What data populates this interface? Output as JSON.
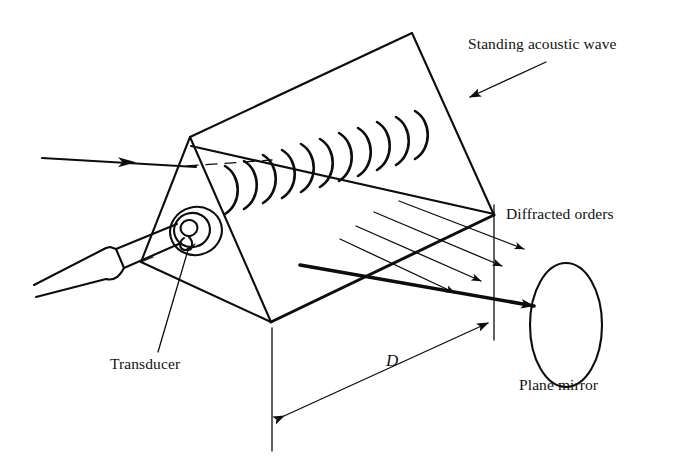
{
  "figure": {
    "background_color": "#ffffff",
    "ink_color": "#0d0d0d"
  },
  "labels": {
    "standing_acoustic_wave": "Standing acoustic wave",
    "diffracted_orders": "Diffracted orders",
    "plane_mirror": "Plane mirror",
    "transducer": "Transducer",
    "distance": "D"
  },
  "components": [
    {
      "name": "acousto-optic-cell",
      "shape": "triangular-prism",
      "vertices": {
        "front_apex": [
          190,
          137
        ],
        "back_apex": [
          412,
          33
        ],
        "front_bottom": [
          271,
          322
        ],
        "left_bottom": [
          141,
          262
        ],
        "right_bottom": [
          494,
          215
        ]
      }
    },
    {
      "name": "transducer",
      "shape": "concentric-ellipses",
      "center": [
        194,
        231
      ],
      "outer_radii": [
        26,
        24
      ],
      "inner_radii": [
        11,
        11
      ]
    },
    {
      "name": "transducer-cable",
      "shape": "tube",
      "from": [
        34,
        296
      ],
      "to": [
        172,
        232
      ]
    },
    {
      "name": "plane-mirror",
      "shape": "ellipse",
      "center": [
        566,
        325
      ],
      "rx": 36,
      "ry": 62
    },
    {
      "name": "standing-acoustic-wave",
      "shape": "arc-series",
      "arc_count": 11,
      "start": [
        220,
        196
      ],
      "end": [
        412,
        112
      ]
    },
    {
      "name": "incident-beam",
      "shape": "arrow",
      "from": [
        42,
        159
      ],
      "to": [
        196,
        167
      ]
    },
    {
      "name": "diffracted-orders",
      "shape": "parallel-ray-bundle",
      "ray_count": 4
    },
    {
      "name": "distance-dimension",
      "shape": "double-arrow",
      "from": [
        279,
        419
      ],
      "to": [
        491,
        321
      ],
      "measures": "D"
    }
  ]
}
